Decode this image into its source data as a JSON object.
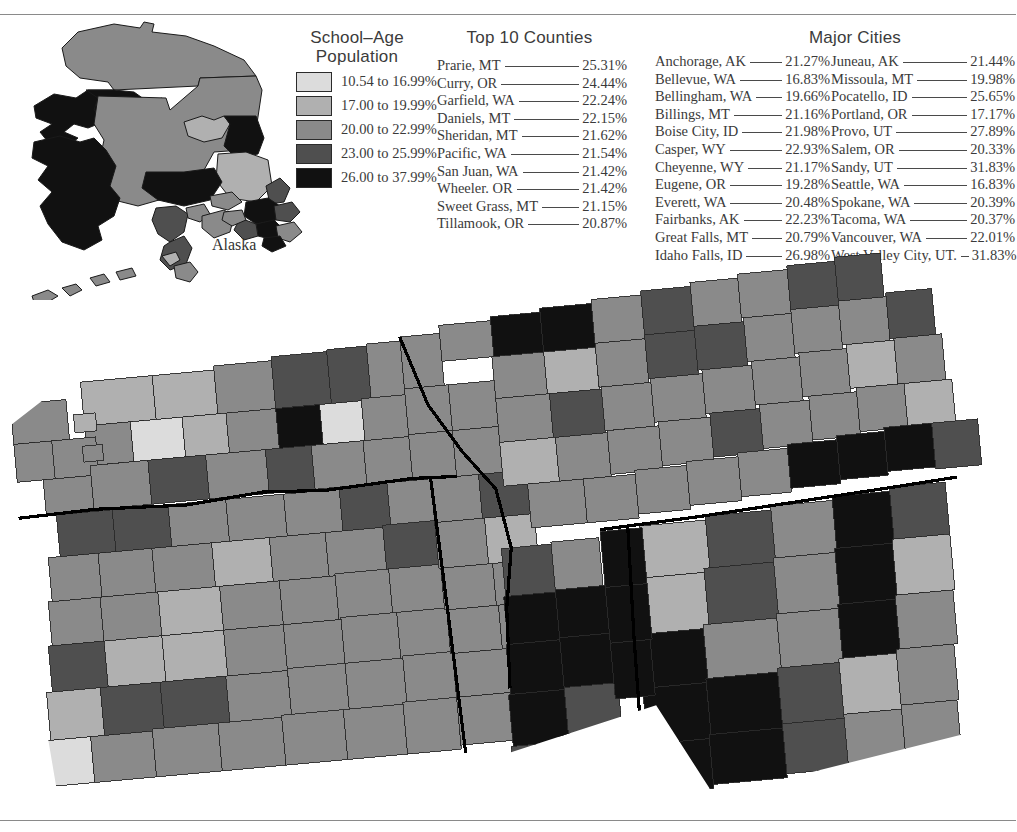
{
  "legend": {
    "title_line1": "School–Age",
    "title_line2": "Population",
    "classes": [
      {
        "label": "10.54 to 16.99%",
        "color": "#dcdcdc"
      },
      {
        "label": "17.00 to 19.99%",
        "color": "#b0b0b0"
      },
      {
        "label": "20.00 to 22.99%",
        "color": "#8a8a8a"
      },
      {
        "label": "23.00 to 25.99%",
        "color": "#4f4f4f"
      },
      {
        "label": "26.00 to 37.99%",
        "color": "#111111"
      }
    ]
  },
  "counties": {
    "title": "Top 10 Counties",
    "items": [
      {
        "name": "Prarie, MT",
        "value": "25.31%"
      },
      {
        "name": "Curry, OR",
        "value": "24.44%"
      },
      {
        "name": "Garfield, WA",
        "value": "22.24%"
      },
      {
        "name": "Daniels, MT",
        "value": "22.15%"
      },
      {
        "name": "Sheridan, MT",
        "value": "21.62%"
      },
      {
        "name": "Pacific, WA",
        "value": "21.54%"
      },
      {
        "name": "San Juan, WA",
        "value": "21.42%"
      },
      {
        "name": "Wheeler. OR",
        "value": "21.42%"
      },
      {
        "name": "Sweet Grass, MT",
        "value": "21.15%"
      },
      {
        "name": "Tillamook, OR",
        "value": "20.87%"
      }
    ]
  },
  "cities": {
    "title": "Major Cities",
    "left": [
      {
        "name": "Anchorage, AK",
        "value": "21.27%"
      },
      {
        "name": "Bellevue, WA",
        "value": "16.83%"
      },
      {
        "name": "Bellingham, WA",
        "value": "19.66%"
      },
      {
        "name": "Billings, MT",
        "value": "21.16%"
      },
      {
        "name": "Boise City, ID",
        "value": "21.98%"
      },
      {
        "name": "Casper, WY",
        "value": "22.93%"
      },
      {
        "name": "Cheyenne, WY",
        "value": "21.17%"
      },
      {
        "name": "Eugene, OR",
        "value": "19.28%"
      },
      {
        "name": "Everett, WA",
        "value": "20.48%"
      },
      {
        "name": "Fairbanks, AK",
        "value": "22.23%"
      },
      {
        "name": "Great Falls, MT",
        "value": "20.79%"
      },
      {
        "name": "Idaho Falls, ID",
        "value": "26.98%"
      }
    ],
    "right": [
      {
        "name": "Juneau, AK",
        "value": "21.44%"
      },
      {
        "name": "Missoula, MT",
        "value": "19.98%"
      },
      {
        "name": "Pocatello, ID",
        "value": "25.65%"
      },
      {
        "name": "Portland, OR",
        "value": "17.17%"
      },
      {
        "name": "Provo, UT",
        "value": "27.89%"
      },
      {
        "name": "Salem, OR",
        "value": "20.33%"
      },
      {
        "name": "Sandy, UT",
        "value": "31.83%"
      },
      {
        "name": "Seattle, WA",
        "value": "16.83%"
      },
      {
        "name": "Spokane, WA",
        "value": "20.39%"
      },
      {
        "name": "Tacoma, WA",
        "value": "20.37%"
      },
      {
        "name": "Vancouver, WA",
        "value": "22.01%"
      },
      {
        "name": "West Valley City, UT.",
        "value": "31.83%"
      }
    ]
  },
  "maps": {
    "alaska_label": "Alaska"
  },
  "chart_data": {
    "type": "map",
    "subtype": "choropleth",
    "title": "School–Age Population",
    "unit": "percent",
    "geography": "US counties — Pacific Northwest / Mountain region (WA, OR, ID, MT, WY, UT) plus Alaska inset",
    "class_breaks": [
      {
        "range": [
          10.54,
          16.99
        ],
        "label": "10.54 to 16.99%",
        "color": "#dcdcdc"
      },
      {
        "range": [
          17.0,
          19.99
        ],
        "label": "17.00 to 19.99%",
        "color": "#b0b0b0"
      },
      {
        "range": [
          20.0,
          22.99
        ],
        "label": "20.00 to 22.99%",
        "color": "#8a8a8a"
      },
      {
        "range": [
          23.0,
          25.99
        ],
        "label": "23.00 to 25.99%",
        "color": "#4f4f4f"
      },
      {
        "range": [
          26.0,
          37.99
        ],
        "label": "26.00 to 37.99%",
        "color": "#111111"
      }
    ],
    "top_counties": [
      {
        "name": "Prarie, MT",
        "value": 25.31
      },
      {
        "name": "Curry, OR",
        "value": 24.44
      },
      {
        "name": "Garfield, WA",
        "value": 22.24
      },
      {
        "name": "Daniels, MT",
        "value": 22.15
      },
      {
        "name": "Sheridan, MT",
        "value": 21.62
      },
      {
        "name": "Pacific, WA",
        "value": 21.54
      },
      {
        "name": "San Juan, WA",
        "value": 21.42
      },
      {
        "name": "Wheeler. OR",
        "value": 21.42
      },
      {
        "name": "Sweet Grass, MT",
        "value": 21.15
      },
      {
        "name": "Tillamook, OR",
        "value": 20.87
      }
    ],
    "major_cities": [
      {
        "name": "Anchorage, AK",
        "value": 21.27
      },
      {
        "name": "Bellevue, WA",
        "value": 16.83
      },
      {
        "name": "Bellingham, WA",
        "value": 19.66
      },
      {
        "name": "Billings, MT",
        "value": 21.16
      },
      {
        "name": "Boise City, ID",
        "value": 21.98
      },
      {
        "name": "Casper, WY",
        "value": 22.93
      },
      {
        "name": "Cheyenne, WY",
        "value": 21.17
      },
      {
        "name": "Eugene, OR",
        "value": 19.28
      },
      {
        "name": "Everett, WA",
        "value": 20.48
      },
      {
        "name": "Fairbanks, AK",
        "value": 22.23
      },
      {
        "name": "Great Falls, MT",
        "value": 20.79
      },
      {
        "name": "Idaho Falls, ID",
        "value": 26.98
      },
      {
        "name": "Juneau, AK",
        "value": 21.44
      },
      {
        "name": "Missoula, MT",
        "value": 19.98
      },
      {
        "name": "Pocatello, ID",
        "value": 25.65
      },
      {
        "name": "Portland, OR",
        "value": 17.17
      },
      {
        "name": "Provo, UT",
        "value": 27.89
      },
      {
        "name": "Salem, OR",
        "value": 20.33
      },
      {
        "name": "Sandy, UT",
        "value": 31.83
      },
      {
        "name": "Seattle, WA",
        "value": 16.83
      },
      {
        "name": "Spokane, WA",
        "value": 20.39
      },
      {
        "name": "Tacoma, WA",
        "value": 20.37
      },
      {
        "name": "Vancouver, WA",
        "value": 22.01
      },
      {
        "name": "West Valley City, UT",
        "value": 31.83
      }
    ]
  }
}
